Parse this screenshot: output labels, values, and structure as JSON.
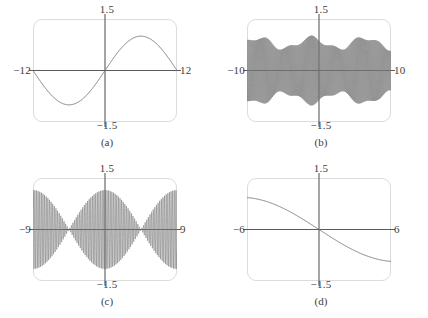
{
  "figure": {
    "background": "#ffffff",
    "frame_color": "#dcdcdc",
    "axis_color": "#5a5a5a",
    "curve_color": "#777777",
    "text_color": "#3d3d3d"
  },
  "chart_data": [
    {
      "id": "a",
      "type": "line",
      "caption": "(a)",
      "title": "",
      "xlabel": "",
      "ylabel": "",
      "xlim": [
        -12,
        12
      ],
      "ylim": [
        -1.5,
        1.5
      ],
      "xtick_left_label": "−12",
      "xtick_right_label": "12",
      "ytick_top_label": "1.5",
      "ytick_bottom_label": "−1.5",
      "grid": false,
      "legend": null,
      "expression": "sin(pi*x/12)",
      "frequency": 0.2617993878,
      "amplitude": 1.0,
      "phase": 0,
      "envelope": null,
      "samples": 900,
      "description": "One full sine cycle: minimum near x = -6, zero at x = 0, maximum near x = 6"
    },
    {
      "id": "b",
      "type": "line",
      "caption": "(b)",
      "title": "",
      "xlabel": "",
      "ylabel": "",
      "xlim": [
        -10,
        10
      ],
      "ylim": [
        -1.5,
        1.5
      ],
      "xtick_left_label": "−10",
      "xtick_right_label": "10",
      "ytick_top_label": "1.5",
      "ytick_bottom_label": "−1.5",
      "grid": false,
      "legend": null,
      "expression": "sin(47*x) aliased",
      "frequency": 47.0,
      "amplitude": 1.0,
      "phase": 0,
      "envelope": "irregular aliasing beats, dips near x = -3.5 and x = 4",
      "samples": 2400,
      "description": "Very high frequency oscillation that aliases into an irregular ragged band filling most of the window"
    },
    {
      "id": "c",
      "type": "line",
      "caption": "(c)",
      "title": "",
      "xlabel": "",
      "ylabel": "",
      "xlim": [
        -9,
        9
      ],
      "ylim": [
        -1.5,
        1.5
      ],
      "xtick_left_label": "−9",
      "xtick_right_label": "9",
      "ytick_top_label": "1.5",
      "ytick_bottom_label": "−1.5",
      "grid": false,
      "legend": null,
      "expression": "sin(31*x)*cos(pi*x/9)",
      "frequency": 31.0,
      "amplitude": 1.15,
      "phase": 0,
      "envelope": "cos(pi*x/9) beat envelope with nodes near x = -4.5 and x = 4.5",
      "samples": 2400,
      "description": "Beat pattern: amplitude peaks at center, pinches to nodes near x = +/-4.5, grows again toward the edges"
    },
    {
      "id": "d",
      "type": "line",
      "caption": "(d)",
      "title": "",
      "xlabel": "",
      "ylabel": "",
      "xlim": [
        -6,
        6
      ],
      "ylim": [
        -1.5,
        1.5
      ],
      "xtick_left_label": "−6",
      "xtick_right_label": "6",
      "ytick_top_label": "1.5",
      "ytick_bottom_label": "−1.5",
      "grid": false,
      "legend": null,
      "expression": "-sin(pi*x/13)*1.05",
      "frequency": -0.2417,
      "amplitude": 0.93,
      "phase": 0,
      "envelope": null,
      "samples": 900,
      "description": "Decreasing S-shaped curve from about y = 0.9 at x = -6 through the origin down to about y = -0.88 at x = 6"
    }
  ]
}
